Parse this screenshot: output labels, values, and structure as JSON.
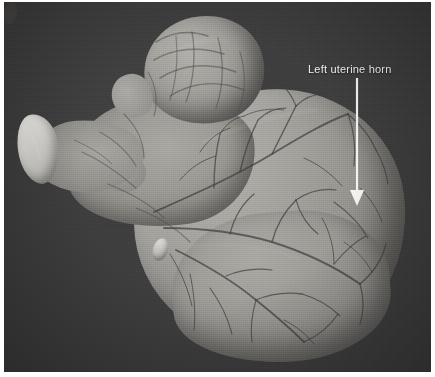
{
  "figure": {
    "kind": "gross-pathology-photograph",
    "background_color": "#3e3e3e",
    "border_color": "#ffffff",
    "tissue_color": "#9c9a95",
    "highlight_tissue_color": "#f0eeea",
    "vessel_color": "#41403e"
  },
  "annotations": [
    {
      "id": "left-uterine-horn",
      "label": "Left uterine horn",
      "color": "#f4f4f2",
      "arrow": {
        "direction": "down",
        "x": 353,
        "y_start": 78,
        "y_end": 202
      }
    }
  ]
}
